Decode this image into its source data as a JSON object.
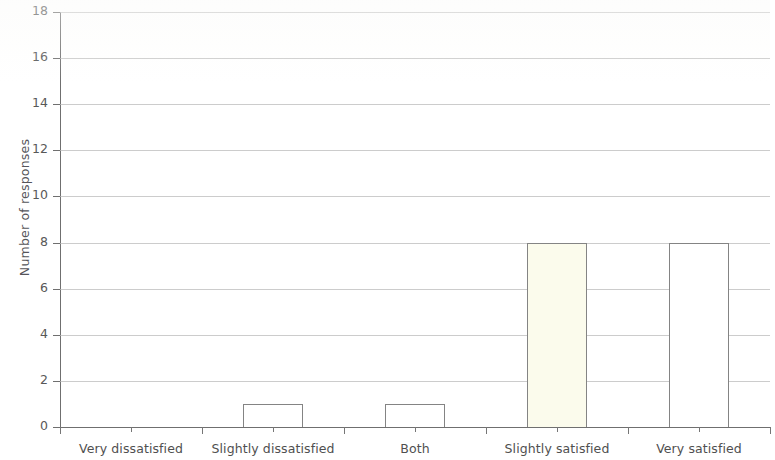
{
  "chart_data": {
    "type": "bar",
    "title": "",
    "xlabel": "",
    "ylabel": "Number of responses",
    "categories": [
      "Very dissatisfied",
      "Slightly dissatisfied",
      "Both",
      "Slightly satisfied",
      "Very satisfied"
    ],
    "values": [
      0,
      1,
      1,
      8,
      8
    ],
    "ylim": [
      0,
      18
    ],
    "ytick_labels": [
      "0",
      "2",
      "4",
      "6",
      "8",
      "10",
      "12",
      "14",
      "16",
      "18"
    ],
    "ytick_values": [
      0,
      2,
      4,
      6,
      8,
      10,
      12,
      14,
      16,
      18
    ],
    "grid": true,
    "legend": "none",
    "bar_colors": [
      "#ffffff",
      "#ffffff",
      "#ffffff",
      "#fbfbec",
      "#ffffff"
    ],
    "bar_border_color": "#848484",
    "axis_color": "#6f6f6f",
    "gridline_color": "#b9b9b9"
  }
}
